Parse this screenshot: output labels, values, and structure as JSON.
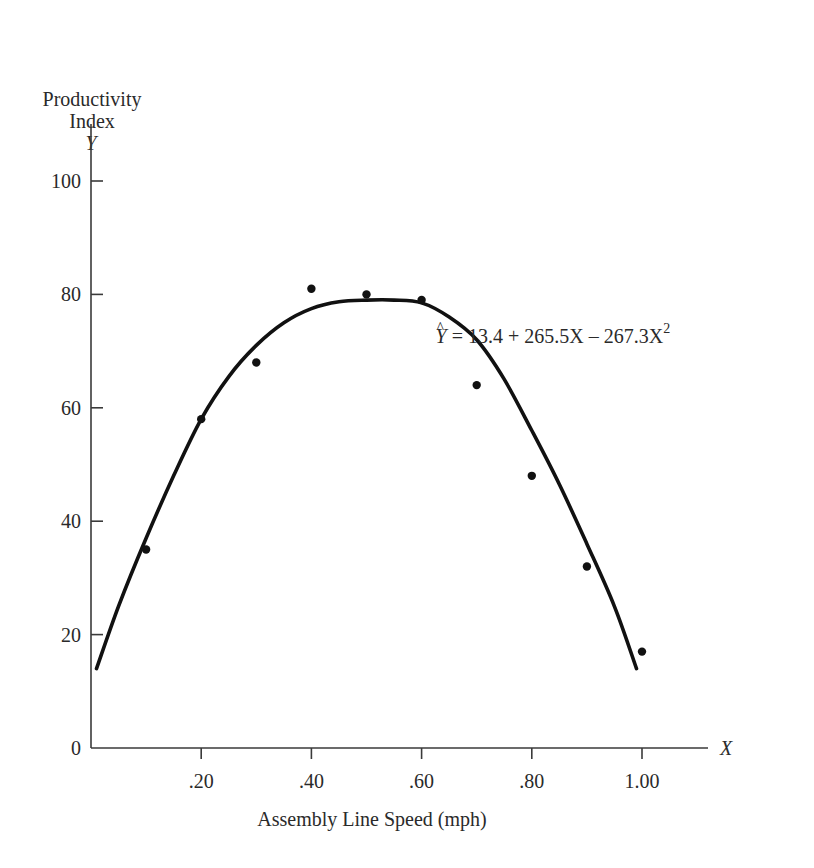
{
  "chart_data": {
    "type": "scatter",
    "title": "",
    "ylabel_lines": [
      "Productivity",
      "Index",
      "Y"
    ],
    "xlabel": "Assembly Line Speed (mph)",
    "x_axis_symbol": "X",
    "xlim": [
      0,
      1.2
    ],
    "ylim": [
      0,
      110
    ],
    "x_ticks": [
      0.2,
      0.4,
      0.6,
      0.8,
      1.0
    ],
    "x_tick_labels": [
      ".20",
      ".40",
      ".60",
      ".80",
      "1.00"
    ],
    "y_ticks": [
      0,
      20,
      40,
      60,
      80,
      100
    ],
    "y_tick_labels": [
      "0",
      "20",
      "40",
      "60",
      "80",
      "100"
    ],
    "grid": false,
    "series": [
      {
        "name": "Observed",
        "kind": "scatter",
        "x": [
          0.1,
          0.2,
          0.3,
          0.4,
          0.5,
          0.6,
          0.7,
          0.8,
          0.9,
          1.0
        ],
        "y": [
          35,
          58,
          68,
          81,
          80,
          79,
          64,
          48,
          32,
          17
        ]
      },
      {
        "name": "Fitted quadratic",
        "kind": "line",
        "x": [
          0.01,
          0.05,
          0.1,
          0.15,
          0.2,
          0.25,
          0.3,
          0.35,
          0.4,
          0.45,
          0.5,
          0.55,
          0.6,
          0.65,
          0.7,
          0.75,
          0.8,
          0.85,
          0.9,
          0.95,
          0.99
        ],
        "y": [
          14,
          25,
          37,
          48,
          58,
          65.5,
          71,
          75,
          77.5,
          78.7,
          79,
          79,
          78.5,
          76,
          72,
          65,
          56,
          46.5,
          36,
          25,
          14
        ]
      }
    ],
    "annotation": {
      "yhat": "Y",
      "equation": " = 13.4 + 265.5X – 267.3X",
      "superscript": "2",
      "anchor_x": 0.62,
      "anchor_y": 72
    }
  }
}
